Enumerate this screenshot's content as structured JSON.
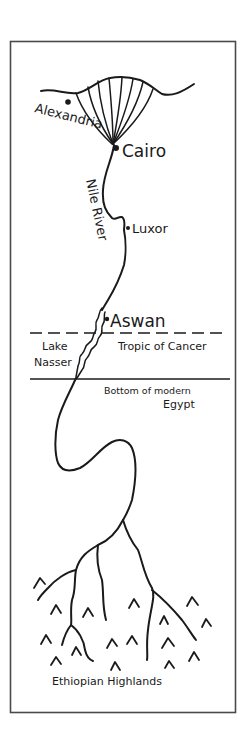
{
  "map": {
    "title": "",
    "frame_color": "#4a4a4a",
    "ink_color": "#1a1a1a",
    "background": "#ffffff",
    "river_label": "Nile River",
    "cities": [
      {
        "name": "Alexandria"
      },
      {
        "name": "Cairo"
      },
      {
        "name": "Luxor"
      },
      {
        "name": "Aswan"
      }
    ],
    "regions": {
      "lake": "Lake Nasser",
      "lake_line1": "Lake",
      "lake_line2": "Nasser",
      "highlands": "Ethiopian Highlands"
    },
    "boundaries": {
      "tropic": "Tropic of Cancer",
      "egypt_border_line1": "Bottom of modern",
      "egypt_border_line2": "Egypt"
    }
  }
}
